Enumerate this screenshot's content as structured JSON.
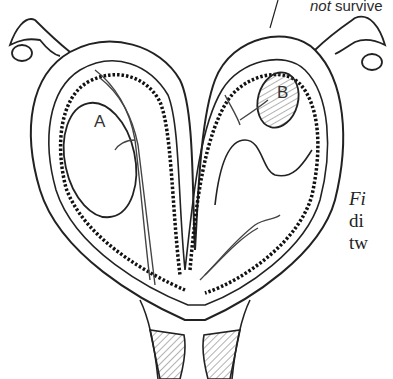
{
  "figure": {
    "annotation_top": {
      "italic": "not",
      "rest": " survive"
    },
    "labels": {
      "embryo_a": "A",
      "embryo_b": "B"
    },
    "caption_partial_lines": [
      "Fi",
      "di",
      "tw"
    ],
    "colors": {
      "ink": "#222222",
      "background": "#ffffff",
      "hatch": "#555555"
    }
  }
}
